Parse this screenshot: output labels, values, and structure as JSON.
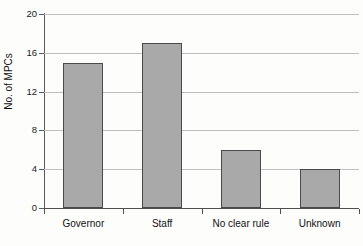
{
  "chart_data": {
    "type": "bar",
    "title": "",
    "xlabel": "",
    "ylabel": "No. of MPCs",
    "categories": [
      "Governor",
      "Staff",
      "No clear rule",
      "Unknown"
    ],
    "values": [
      15,
      17,
      6,
      4
    ],
    "ylim": [
      0,
      20
    ],
    "yticks": [
      "0",
      "4",
      "8",
      "12",
      "16",
      "20"
    ],
    "ytick_values": [
      0,
      4,
      8,
      12,
      16,
      20
    ],
    "grid": "horizontal",
    "legend": "none",
    "colors": {
      "bar_fill": "#a9a9a9",
      "bar_border": "#4a4a4a",
      "gridline": "#bfbfbf",
      "axis": "#4f4f4f",
      "text": "#111111",
      "background": "#fdfdfc"
    }
  }
}
